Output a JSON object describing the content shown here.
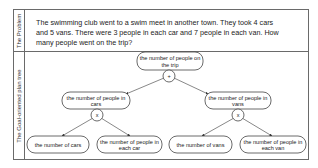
{
  "sections": {
    "problem_label": "The Problem",
    "tree_label": "The Goal-oriented plan tree"
  },
  "problem": {
    "text": "The swimming club went to a swim meet in another town. They took 4 cars and 5 vans. There were 3 people in each car and 7 people in each van. How many people went on the trip?"
  },
  "tree": {
    "root": {
      "line1": "the number of people on",
      "line2": "the trip",
      "operator": "+"
    },
    "left": {
      "line1": "the number of people in",
      "line2": "cars",
      "operator": "x"
    },
    "right": {
      "line1": "the number of people in",
      "line2": "vans",
      "operator": "x"
    },
    "leaves": [
      {
        "line1": "the number of cars",
        "line2": ""
      },
      {
        "line1": "the number of people in",
        "line2": "each car"
      },
      {
        "line1": "the number of vans",
        "line2": ""
      },
      {
        "line1": "the number of people in",
        "line2": "each van"
      }
    ]
  },
  "colors": {
    "border": "#6a6a6a",
    "node_stroke": "#444444",
    "background": "#ffffff"
  }
}
